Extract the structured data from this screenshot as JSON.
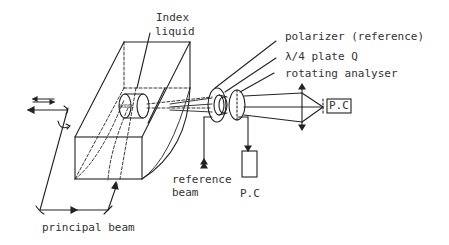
{
  "diagram": {
    "type": "optical-setup-schematic",
    "stroke_color": "#222222",
    "text_color": "#333333",
    "labels": {
      "index_liquid_line1": "Index",
      "index_liquid_line2": "liquid",
      "model": "MODEL",
      "polarizer": "polarizer (reference)",
      "quarter_wave_plate": "λ/4 plate  Q",
      "rotating_analyser": "rotating analyser",
      "pc_right": "P.C",
      "reference_beam_line1": "reference",
      "reference_beam_line2": "beam",
      "pc_bottom": "P.C",
      "principal_beam": "principal beam"
    },
    "components": [
      {
        "id": "index-liquid-tank",
        "label": "Index liquid"
      },
      {
        "id": "model",
        "label": "MODEL"
      },
      {
        "id": "polarizer",
        "label": "polarizer (reference)"
      },
      {
        "id": "quarter-wave-plate",
        "label": "λ/4 plate Q"
      },
      {
        "id": "rotating-analyser",
        "label": "rotating analyser"
      },
      {
        "id": "photocell-main",
        "label": "P.C"
      },
      {
        "id": "photocell-reference",
        "label": "P.C"
      }
    ],
    "beams": [
      {
        "id": "principal-beam",
        "label": "principal beam"
      },
      {
        "id": "reference-beam",
        "label": "reference beam"
      }
    ]
  }
}
